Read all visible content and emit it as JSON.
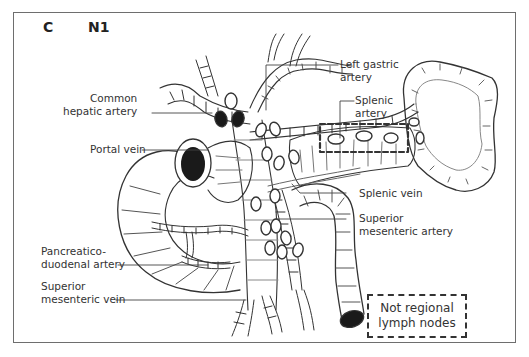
{
  "figure": {
    "panel_letter": "C",
    "stage": "N1",
    "colors": {
      "line": "#333333",
      "frame": "#6e6e6e",
      "node_regional_fill": "#ffffff",
      "node_involved_fill": "#1a1a1a",
      "dashed_box": "#333333"
    }
  },
  "labels": {
    "common_hepatic_artery": [
      "Common",
      "hepatic artery"
    ],
    "portal_vein": "Portal vein",
    "pancreaticoduodenal_artery": [
      "Pancreatico-",
      "duodenal artery"
    ],
    "superior_mesenteric_vein": [
      "Superior",
      "mesenteric vein"
    ],
    "left_gastric_artery": [
      "Left gastric",
      "artery"
    ],
    "splenic_artery": [
      "Splenic",
      "artery"
    ],
    "splenic_vein": "Splenic vein",
    "superior_mesenteric_artery": [
      "Superior",
      "mesenteric artery"
    ]
  },
  "legend": {
    "lines": [
      "Not regional",
      "lymph nodes"
    ],
    "style": "dashed-box"
  }
}
